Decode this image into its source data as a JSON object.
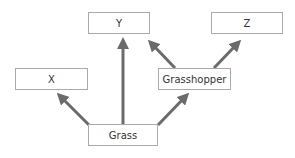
{
  "diagram": {
    "nodes": [
      {
        "id": "Y",
        "label": "Y",
        "x": 88,
        "y": 12,
        "w": 62,
        "h": 22
      },
      {
        "id": "Z",
        "label": "Z",
        "x": 211,
        "y": 12,
        "w": 72,
        "h": 22
      },
      {
        "id": "X",
        "label": "X",
        "x": 15,
        "y": 68,
        "w": 73,
        "h": 22
      },
      {
        "id": "Grasshopper",
        "label": "Grasshopper",
        "x": 158,
        "y": 68,
        "w": 73,
        "h": 22
      },
      {
        "id": "Grass",
        "label": "Grass",
        "x": 88,
        "y": 124,
        "w": 70,
        "h": 22
      }
    ],
    "edges": [
      {
        "from": "Grass",
        "to": "X"
      },
      {
        "from": "Grass",
        "to": "Y"
      },
      {
        "from": "Grass",
        "to": "Grasshopper"
      },
      {
        "from": "Grasshopper",
        "to": "Y"
      },
      {
        "from": "Grasshopper",
        "to": "Z"
      }
    ],
    "arrow_color": "#6b6b6b"
  }
}
